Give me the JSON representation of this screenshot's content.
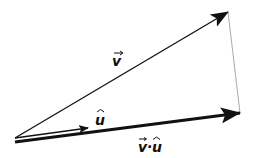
{
  "diagram": {
    "colors": {
      "vector": "#111111",
      "projection_line": "#aaaaaa",
      "background": "#ffffff"
    },
    "vectors": [
      {
        "id": "v",
        "label": "v",
        "accent": "→",
        "from": [
          15,
          138
        ],
        "to": [
          228,
          12
        ],
        "stroke_width": 1.3
      },
      {
        "id": "u_hat",
        "label": "u",
        "accent": "^",
        "from": [
          15,
          138
        ],
        "to": [
          88,
          128
        ],
        "stroke_width": 1.3
      },
      {
        "id": "v_dot_u",
        "label": "v·u",
        "from": [
          15,
          142
        ],
        "to": [
          240,
          113
        ],
        "stroke_width": 3
      }
    ],
    "labels": {
      "v": "v",
      "u": "u",
      "vdotu_v": "v",
      "vdotu_dot": "·",
      "vdotu_u": "u"
    }
  }
}
